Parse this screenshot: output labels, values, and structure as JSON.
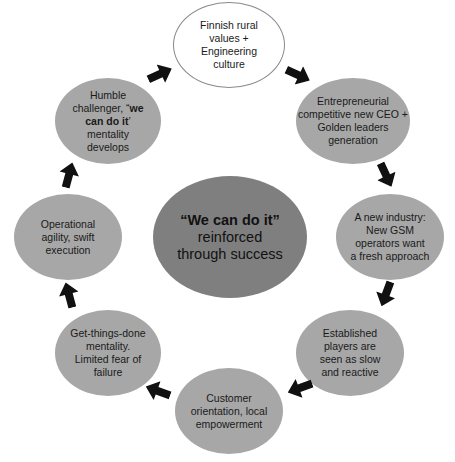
{
  "diagram": {
    "type": "cycle",
    "center": {
      "bold_text": "“We can do it”",
      "line2": "reinforced",
      "line3": "through success"
    },
    "nodes": [
      {
        "id": "n1",
        "lines": [
          "Finnish rural",
          "values +",
          "Engineering",
          "culture"
        ]
      },
      {
        "id": "n2",
        "lines": [
          "Entrepreneurial",
          "competitive new CEO +",
          "Golden leaders",
          "generation"
        ]
      },
      {
        "id": "n3",
        "lines": [
          "A new industry:",
          "New GSM",
          "operators want",
          "a fresh approach"
        ]
      },
      {
        "id": "n4",
        "lines": [
          "Established",
          "players are",
          "seen as slow",
          "and reactive"
        ]
      },
      {
        "id": "n5",
        "lines": [
          "Customer",
          "orientation, local",
          "empowerment"
        ]
      },
      {
        "id": "n6",
        "lines": [
          "Get-things-done",
          "mentality.",
          "Limited fear of",
          "failure"
        ]
      },
      {
        "id": "n7",
        "lines": [
          "Operational",
          "agility, swift",
          "execution"
        ]
      },
      {
        "id": "n8",
        "line1": "Humble",
        "line2_pre": "challenger, “",
        "line2_bold": "we",
        "line3_bold": "can do it",
        "line3_post": "’",
        "line4": "mentality",
        "line5": "develops"
      }
    ],
    "edges": [
      {
        "from": "n1",
        "to": "n2"
      },
      {
        "from": "n2",
        "to": "n3"
      },
      {
        "from": "n3",
        "to": "n4"
      },
      {
        "from": "n4",
        "to": "n5"
      },
      {
        "from": "n5",
        "to": "n6"
      },
      {
        "from": "n6",
        "to": "n7"
      },
      {
        "from": "n7",
        "to": "n8"
      },
      {
        "from": "n8",
        "to": "n1"
      }
    ],
    "colors": {
      "outer_fill": "#a7a7a7",
      "center_fill": "#7f7f7f",
      "start_fill": "#ffffff",
      "arrow": "#111111"
    }
  }
}
